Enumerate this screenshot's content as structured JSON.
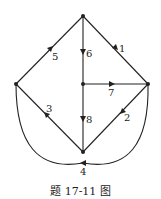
{
  "diagram": {
    "type": "directed-graph",
    "nodes": [
      {
        "id": "top",
        "x": 83,
        "y": 16
      },
      {
        "id": "left",
        "x": 16,
        "y": 84
      },
      {
        "id": "center",
        "x": 83,
        "y": 84
      },
      {
        "id": "right",
        "x": 148,
        "y": 84
      },
      {
        "id": "bottom",
        "x": 83,
        "y": 152
      }
    ],
    "edges": [
      {
        "label": "1",
        "from": "top",
        "to": "right"
      },
      {
        "label": "2",
        "from": "right",
        "to": "bottom"
      },
      {
        "label": "3",
        "from": "bottom",
        "to": "left"
      },
      {
        "label": "4",
        "from": "left",
        "to": "right",
        "shape": "arc"
      },
      {
        "label": "5",
        "from": "left",
        "to": "top"
      },
      {
        "label": "6",
        "from": "top",
        "to": "center"
      },
      {
        "label": "7",
        "from": "center",
        "to": "right"
      },
      {
        "label": "8",
        "from": "center",
        "to": "bottom"
      }
    ],
    "caption": "题 17-11 图"
  }
}
